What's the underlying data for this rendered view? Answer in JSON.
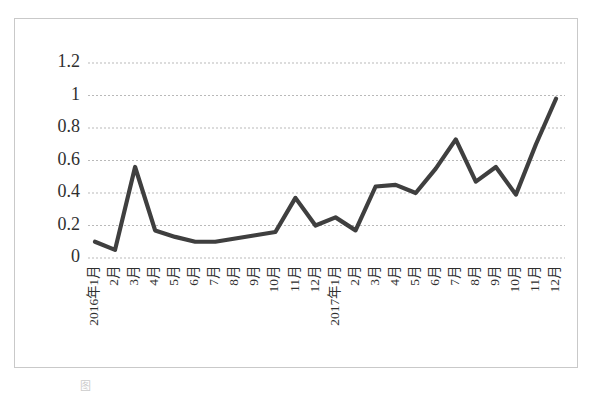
{
  "figure": {
    "frame_color": "#c9c9c9",
    "background": "#ffffff",
    "caption_partial": "图"
  },
  "chart_data": {
    "type": "line",
    "title": "",
    "subtitle": "",
    "xlabel": "",
    "ylabel": "",
    "grid": true,
    "legend": null,
    "legend_position": "none",
    "line_color": "#3f3f3f",
    "ylim": [
      0,
      1.2
    ],
    "ytick_labels": [
      "1.2",
      "1",
      "0.8",
      "0.6",
      "0.4",
      "0.2",
      "0"
    ],
    "ytick_values": [
      1.2,
      1.0,
      0.8,
      0.6,
      0.4,
      0.2,
      0
    ],
    "categories": [
      "2016年1月",
      "2月",
      "3月",
      "4月",
      "5月",
      "6月",
      "7月",
      "8月",
      "9月",
      "10月",
      "11月",
      "12月",
      "2017年1月",
      "2月",
      "3月",
      "4月",
      "5月",
      "6月",
      "7月",
      "8月",
      "9月",
      "10月",
      "11月",
      "12月"
    ],
    "values": [
      0.1,
      0.05,
      0.56,
      0.17,
      0.13,
      0.1,
      0.1,
      0.12,
      0.14,
      0.16,
      0.37,
      0.2,
      0.25,
      0.17,
      0.44,
      0.45,
      0.4,
      0.55,
      0.73,
      0.47,
      0.56,
      0.39,
      0.7,
      0.98
    ],
    "series": [
      {
        "name": "",
        "values": [
          0.1,
          0.05,
          0.56,
          0.17,
          0.13,
          0.1,
          0.1,
          0.12,
          0.14,
          0.16,
          0.37,
          0.2,
          0.25,
          0.17,
          0.44,
          0.45,
          0.4,
          0.55,
          0.73,
          0.47,
          0.56,
          0.39,
          0.7,
          0.98
        ]
      }
    ]
  }
}
